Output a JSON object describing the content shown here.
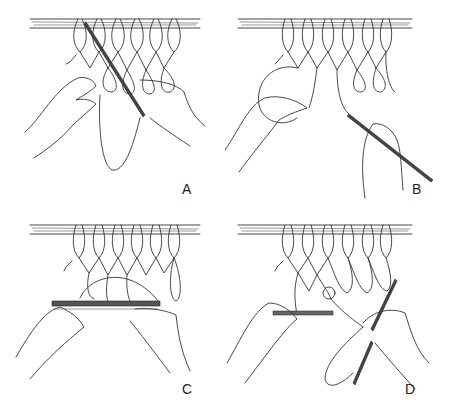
{
  "figure": {
    "panels": [
      {
        "id": "A",
        "label": "A",
        "description": "Netting needle passed through loop while holding mesh gauge"
      },
      {
        "id": "B",
        "label": "B",
        "description": "Twine looped around hand and needle pulled to the right"
      },
      {
        "id": "C",
        "label": "C",
        "description": "Both hands holding gauge while twine drawn over mesh"
      },
      {
        "id": "D",
        "label": "D",
        "description": "Knot tightened and needle pulled down-right"
      }
    ]
  },
  "colors": {
    "line": "#333333",
    "background": "#ffffff"
  }
}
